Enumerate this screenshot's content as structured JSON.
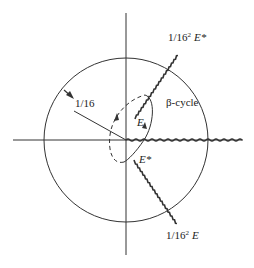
{
  "diagram": {
    "labels": {
      "upper_branch": "1/16",
      "upper_branch_sup": "2",
      "upper_branch_sym": "E*",
      "lower_branch": "1/16",
      "lower_branch_sup": "2",
      "lower_branch_sym": "E",
      "radius": "1/16",
      "cycle": "β-cycle",
      "point_e": "E",
      "point_e_star": "E*"
    },
    "colors": {
      "ink": "#222222",
      "background": "#ffffff"
    }
  }
}
